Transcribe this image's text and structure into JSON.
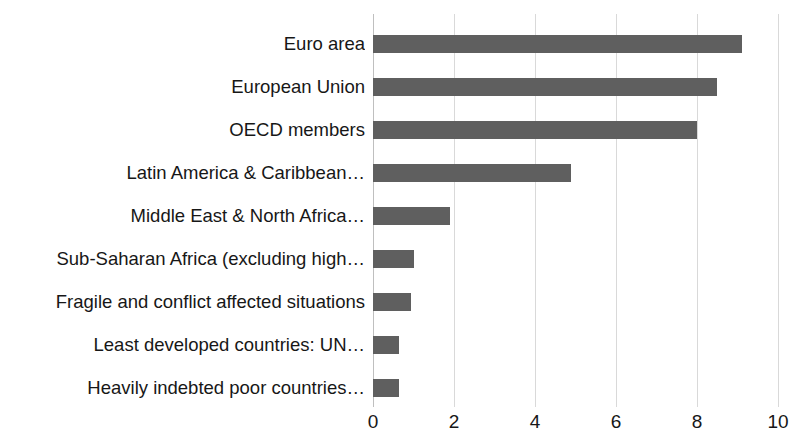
{
  "chart_data": {
    "type": "bar",
    "orientation": "horizontal",
    "title": "",
    "subtitle": "",
    "xlabel": "",
    "ylabel": "",
    "xlim": [
      0,
      10
    ],
    "ylim": null,
    "grid": true,
    "legend": false,
    "legend_position": "none",
    "bar_color": "#5f5f5f",
    "gridline_color": "#d9d9d9",
    "xticks": [
      "0",
      "2",
      "4",
      "6",
      "8",
      "10"
    ],
    "xtick_values": [
      0,
      2,
      4,
      6,
      8,
      10
    ],
    "categories": [
      "Euro area",
      "European Union",
      "OECD members",
      "Latin America & Caribbean…",
      "Middle East & North Africa…",
      "Sub-Saharan Africa (excluding high…",
      "Fragile and conflict affected situations",
      "Least developed countries: UN…",
      "Heavily indebted poor countries…"
    ],
    "values": [
      9.1,
      8.5,
      8.0,
      4.9,
      1.9,
      1.0,
      0.95,
      0.65,
      0.65
    ]
  }
}
